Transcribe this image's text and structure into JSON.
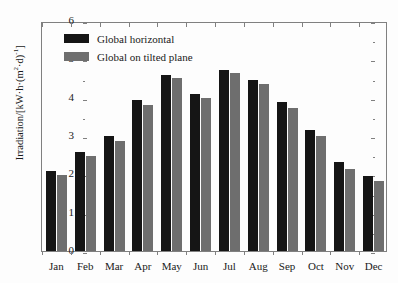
{
  "chart_data": {
    "type": "bar",
    "title": "",
    "xlabel": "",
    "ylabel": "Irradiation/[kW·h·(m²·d)⁻¹]",
    "ylim": [
      0,
      6
    ],
    "ytick_step": 1,
    "yticks": [
      "0",
      "1",
      "2",
      "3",
      "4",
      "5",
      "6"
    ],
    "grid": false,
    "legend_position": "top-left",
    "categories": [
      "Jan",
      "Feb",
      "Mar",
      "Apr",
      "May",
      "Jun",
      "Jul",
      "Aug",
      "Sep",
      "Oct",
      "Nov",
      "Dec"
    ],
    "series": [
      {
        "name": "Global horizontal",
        "color": "#151515",
        "values": [
          2.1,
          2.57,
          3.0,
          3.93,
          4.58,
          4.09,
          4.73,
          4.45,
          3.88,
          3.15,
          2.31,
          1.95
        ]
      },
      {
        "name": "Global on tilted plane",
        "color": "#6e6e6e",
        "values": [
          1.97,
          2.47,
          2.88,
          3.82,
          4.52,
          3.98,
          4.65,
          4.35,
          3.74,
          3.01,
          2.13,
          1.82
        ]
      }
    ]
  },
  "legend": {
    "entries": [
      {
        "label": "Global horizontal",
        "swatch": "#151515"
      },
      {
        "label": "Global on tilted plane",
        "swatch": "#6e6e6e"
      }
    ]
  },
  "axes": {
    "y_title_main": "Irradiation/[kW·h·(m",
    "y_title_sup1": "2",
    "y_title_mid": "·d)",
    "y_title_sup2": "-1",
    "y_title_end": "]"
  }
}
